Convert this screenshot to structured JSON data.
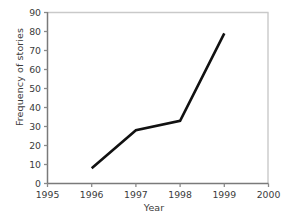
{
  "chart_data": {
    "type": "line",
    "title": "",
    "xlabel": "Year",
    "ylabel": "Frequency of stories",
    "x": [
      1996,
      1997,
      1998,
      1999
    ],
    "values": [
      8,
      28,
      33,
      79
    ],
    "series": [
      {
        "name": "Frequency of stories",
        "x": [
          1996,
          1997,
          1998,
          1999
        ],
        "values": [
          8,
          28,
          33,
          79
        ],
        "color": "#111111"
      }
    ],
    "xlim": [
      1995,
      2000
    ],
    "ylim": [
      0,
      90
    ],
    "xticks": [
      1995,
      1996,
      1997,
      1998,
      1999,
      2000
    ],
    "xtick_labels": [
      "1995",
      "1996",
      "1997",
      "1998",
      "1999",
      "2000"
    ],
    "yticks": [
      0,
      10,
      20,
      30,
      40,
      50,
      60,
      70,
      80,
      90
    ],
    "ytick_labels": [
      "0",
      "10",
      "20",
      "30",
      "40",
      "50",
      "60",
      "70",
      "80",
      "90"
    ],
    "grid": false,
    "legend": false,
    "legend_position": "none",
    "markers": false,
    "line_color": "#111111",
    "line_width": 2.6,
    "background_color": "#ffffff",
    "axis_color": "#7a7a7a",
    "frame_color": "#c9c9c9",
    "tick_color": "#8a8a8a",
    "text_color": "#3b3b3b"
  }
}
